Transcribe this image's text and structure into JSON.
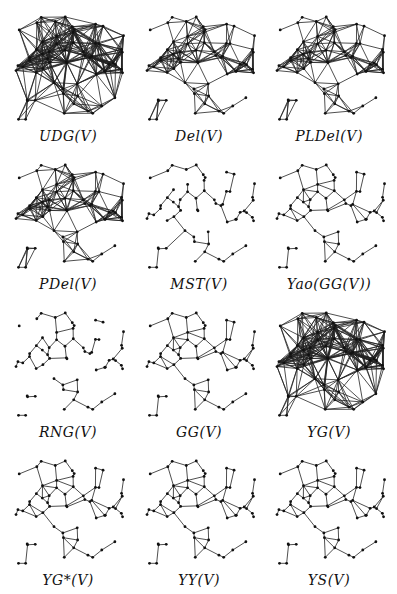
{
  "figure": {
    "panels": [
      {
        "id": "udg",
        "label": "UDG(V)",
        "density": "dense"
      },
      {
        "id": "del",
        "label": "Del(V)",
        "density": "triangulation"
      },
      {
        "id": "pldel",
        "label": "PLDel(V)",
        "density": "triangulation"
      },
      {
        "id": "pdel",
        "label": "PDel(V)",
        "density": "triangulation"
      },
      {
        "id": "mst",
        "label": "MST(V)",
        "density": "tree"
      },
      {
        "id": "yaogg",
        "label": "Yao(GG(V))",
        "density": "planar"
      },
      {
        "id": "rng",
        "label": "RNG(V)",
        "density": "sparse"
      },
      {
        "id": "gg",
        "label": "GG(V)",
        "density": "planar"
      },
      {
        "id": "yg",
        "label": "YG(V)",
        "density": "dense"
      },
      {
        "id": "ygstar",
        "label": "YG*(V)",
        "density": "planar"
      },
      {
        "id": "yy",
        "label": "YY(V)",
        "density": "planar"
      },
      {
        "id": "ys",
        "label": "YS(V)",
        "density": "planar"
      }
    ]
  }
}
